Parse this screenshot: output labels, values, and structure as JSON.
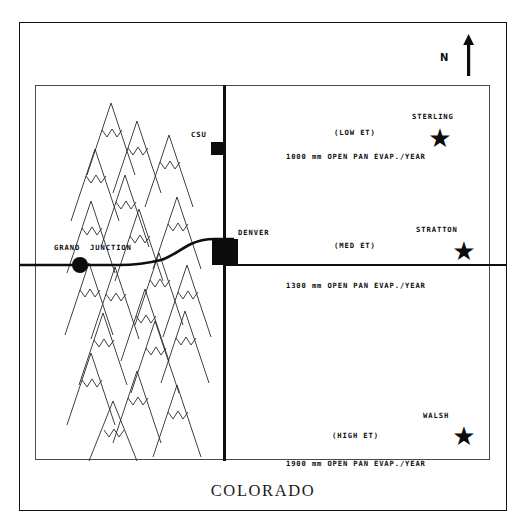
{
  "figure": {
    "title": "COLORADO",
    "domain": "map"
  },
  "compass": {
    "label": "N",
    "icon": "north-arrow-icon"
  },
  "cities": [
    {
      "id": "sterling",
      "label": "STERLING",
      "marker": "star-marker"
    },
    {
      "id": "stratton",
      "label": "STRATTON",
      "marker": "star-marker"
    },
    {
      "id": "walsh",
      "label": "WALSH",
      "marker": "star-marker"
    },
    {
      "id": "csu",
      "label": "CSU",
      "marker": "square-marker"
    },
    {
      "id": "denver",
      "label": "DENVER",
      "marker": "square-marker"
    },
    {
      "id": "grand_junction",
      "label_part1": "GRAND",
      "label_part2": "JUNCTION",
      "marker": "circle-marker"
    }
  ],
  "zones": [
    {
      "id": "north",
      "et_label": "(LOW ET)",
      "evap_label": "1000 mm OPEN PAN EVAP./YEAR",
      "evap_value": 1000,
      "evap_units": "mm",
      "et_level": "LOW"
    },
    {
      "id": "central",
      "et_label": "(MED ET)",
      "evap_label": "1300 mm OPEN PAN EVAP./YEAR",
      "evap_value": 1300,
      "evap_units": "mm",
      "et_level": "MED"
    },
    {
      "id": "south",
      "et_label": "(HIGH ET)",
      "evap_label": "1900 mm OPEN PAN EVAP./YEAR",
      "evap_value": 1900,
      "evap_units": "mm",
      "et_level": "HIGH"
    }
  ],
  "symbols": {
    "mountain_range": "mountain-range-icon",
    "star": "★"
  },
  "colors": {
    "ink": "#0c0c0c",
    "frame": "#121212",
    "inner_frame": "#4a4a4a",
    "background": "#ffffff"
  }
}
